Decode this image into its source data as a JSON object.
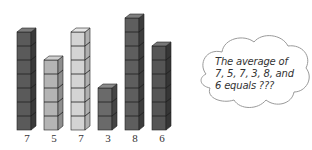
{
  "chart_data": {
    "type": "bar",
    "title": "",
    "categories": [
      "7",
      "5",
      "7",
      "3",
      "8",
      "6"
    ],
    "values": [
      7,
      5,
      7,
      3,
      8,
      6
    ],
    "xlabel": "",
    "ylabel": "",
    "grid": false,
    "legend": null,
    "style": "stacked unit cubes (3D)",
    "bar_shades": [
      "dark",
      "light",
      "lighter",
      "dark",
      "dark",
      "dark"
    ],
    "annotation": "The average of 7, 5, 7, 3, 8, and 6 equals ???"
  },
  "bars": [
    {
      "value": 7,
      "label": "7",
      "front": "#5a5a5a",
      "side": "#3a3a3a",
      "top": "#7a7a7a"
    },
    {
      "value": 5,
      "label": "5",
      "front": "#b4b4b4",
      "side": "#8e8e8e",
      "top": "#cfcfcf"
    },
    {
      "value": 7,
      "label": "7",
      "front": "#d4d4d4",
      "side": "#b0b0b0",
      "top": "#e6e6e6"
    },
    {
      "value": 3,
      "label": "3",
      "front": "#6a6a6a",
      "side": "#454545",
      "top": "#8a8a8a"
    },
    {
      "value": 8,
      "label": "8",
      "front": "#5e5e5e",
      "side": "#3c3c3c",
      "top": "#7e7e7e"
    },
    {
      "value": 6,
      "label": "6",
      "front": "#555555",
      "side": "#363636",
      "top": "#767676"
    }
  ],
  "cloud": {
    "lines": [
      "The average of",
      "7, 5, 7, 3, 8, and",
      "6 equals ???"
    ]
  }
}
